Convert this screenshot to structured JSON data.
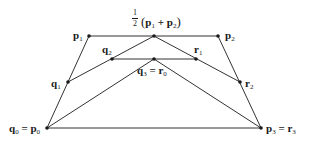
{
  "diagram": {
    "type": "de-casteljau-subdivision",
    "colors": {
      "line": "#333333",
      "point": "#1a1a1a",
      "text": "#1a1a1a",
      "background": "#ffffff"
    },
    "points": {
      "p0": {
        "x": 47,
        "y": 128
      },
      "p1": {
        "x": 89,
        "y": 36
      },
      "p2": {
        "x": 218,
        "y": 36
      },
      "p3": {
        "x": 261,
        "y": 128
      },
      "m12": {
        "x": 154,
        "y": 36
      },
      "q1": {
        "x": 68,
        "y": 82
      },
      "q2": {
        "x": 112,
        "y": 59
      },
      "q3": {
        "x": 154,
        "y": 59
      },
      "r1": {
        "x": 196,
        "y": 59
      },
      "r2": {
        "x": 240,
        "y": 82
      }
    },
    "labels": {
      "p1": {
        "main": "p",
        "sub": "1"
      },
      "p2": {
        "main": "p",
        "sub": "2"
      },
      "q1": {
        "main": "q",
        "sub": "1"
      },
      "q2": {
        "main": "q",
        "sub": "2"
      },
      "r1": {
        "main": "r",
        "sub": "1"
      },
      "r2": {
        "main": "r",
        "sub": "2"
      },
      "q3r0": {
        "a": "q",
        "a_sub": "3",
        "eq": " = ",
        "b": "r",
        "b_sub": "0"
      },
      "q0p0": {
        "a": "q",
        "a_sub": "0",
        "eq": " = ",
        "b": "p",
        "b_sub": "0"
      },
      "p3r3": {
        "a": "p",
        "a_sub": "3",
        "eq": " = ",
        "b": "r",
        "b_sub": "3"
      },
      "midpoint": {
        "frac_num": "1",
        "frac_den": "2",
        "open": "(",
        "a": "p",
        "a_sub": "1",
        "plus": " + ",
        "b": "p",
        "b_sub": "2",
        "close": ")"
      }
    }
  }
}
